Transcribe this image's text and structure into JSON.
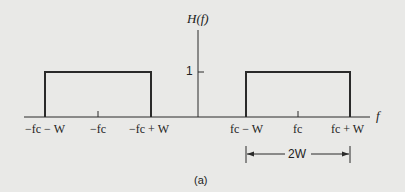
{
  "diagram": {
    "y_axis_label": "H(f)",
    "x_axis_label": "f",
    "level_label": "1",
    "x_ticks": [
      "−f c − W",
      "−f c",
      "−f c + W",
      "f c − W",
      "f c",
      "f c + W"
    ],
    "tick_labels": {
      "neg_low": "−fc − W",
      "neg_center": "−fc",
      "neg_high": "−fc + W",
      "pos_low": "fc − W",
      "pos_center": "fc",
      "pos_high": "fc + W"
    },
    "bandwidth_label": "2W",
    "caption": "(a)",
    "colors": {
      "line": "#2a2a2a",
      "background": "#e9e9e7"
    }
  }
}
